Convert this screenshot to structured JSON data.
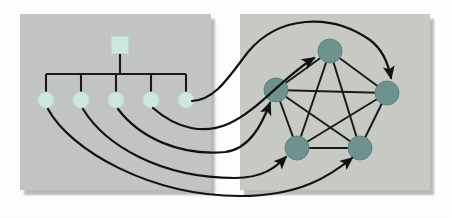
{
  "figure": {
    "width": 452,
    "height": 218,
    "background_color": "#ffffff"
  },
  "colors": {
    "panel_fill": "#c3c6c2",
    "panel_fill_right": "#c9ccc6",
    "panel_shadow": "#b0b3af",
    "tree_node_fill": "#cfeae3",
    "tree_node_stroke": "#bcded6",
    "graph_node_fill": "#6f9490",
    "graph_node_stroke": "#5d8480",
    "edge_color": "#1a1a1a",
    "arrow_color": "#111111",
    "tree_link_color": "#1a1a1a"
  },
  "panels": [
    {
      "name": "tree-panel",
      "label": "Tree panel",
      "x": 20,
      "y": 14,
      "width": 191,
      "height": 176
    },
    {
      "name": "graph-panel",
      "label": "Graph panel",
      "x": 240,
      "y": 14,
      "width": 190,
      "height": 176
    }
  ],
  "tree": {
    "label": "Hierarchy tree",
    "root": {
      "id": "root",
      "shape": "square",
      "x": 120,
      "y": 45,
      "size": 17
    },
    "bus": {
      "y": 74,
      "x_start": 46,
      "x_end": 186,
      "stem_top": 54,
      "stem_bottom": 74
    },
    "leaves": [
      {
        "id": "leaf-1",
        "x": 46,
        "y": 100,
        "r": 8
      },
      {
        "id": "leaf-2",
        "x": 81,
        "y": 100,
        "r": 8
      },
      {
        "id": "leaf-3",
        "x": 116,
        "y": 100,
        "r": 8
      },
      {
        "id": "leaf-4",
        "x": 151,
        "y": 100,
        "r": 8
      },
      {
        "id": "leaf-5",
        "x": 186,
        "y": 100,
        "r": 8
      }
    ]
  },
  "graph": {
    "label": "Complete graph K5",
    "node_radius": 12,
    "nodes": [
      {
        "id": "g-top",
        "x": 330,
        "y": 51
      },
      {
        "id": "g-left",
        "x": 276,
        "y": 90
      },
      {
        "id": "g-right",
        "x": 387,
        "y": 93
      },
      {
        "id": "g-bottom-left",
        "x": 297,
        "y": 148
      },
      {
        "id": "g-bottom-right",
        "x": 360,
        "y": 148
      }
    ],
    "edges": [
      [
        "g-top",
        "g-left"
      ],
      [
        "g-top",
        "g-right"
      ],
      [
        "g-top",
        "g-bottom-left"
      ],
      [
        "g-top",
        "g-bottom-right"
      ],
      [
        "g-left",
        "g-right"
      ],
      [
        "g-left",
        "g-bottom-left"
      ],
      [
        "g-left",
        "g-bottom-right"
      ],
      [
        "g-right",
        "g-bottom-left"
      ],
      [
        "g-right",
        "g-bottom-right"
      ],
      [
        "g-bottom-left",
        "g-bottom-right"
      ]
    ]
  },
  "mappings": [
    {
      "id": "map-1",
      "from": "leaf-1",
      "to": "g-bottom-right",
      "path": "M 48 109 C 70 150, 150 196, 240 196 C 300 196, 330 176, 352 158"
    },
    {
      "id": "map-2",
      "from": "leaf-2",
      "to": "g-bottom-left",
      "path": "M 83 109 C 105 145, 160 178, 235 178 C 262 178, 275 168, 286 157"
    },
    {
      "id": "map-3",
      "from": "leaf-3",
      "to": "g-left",
      "path": "M 118 109 C 140 138, 180 156, 225 152 C 250 149, 262 124, 270 103"
    },
    {
      "id": "map-4",
      "from": "leaf-4",
      "to": "g-top",
      "path": "M 153 108 C 178 130, 205 134, 228 124 C 258 111, 282 78, 314 58"
    },
    {
      "id": "map-5",
      "from": "leaf-5",
      "to": "g-right",
      "path": "M 192 101 C 215 100, 228 78, 248 52 C 278 16, 330 12, 370 40 C 382 49, 388 62, 391 78"
    }
  ]
}
